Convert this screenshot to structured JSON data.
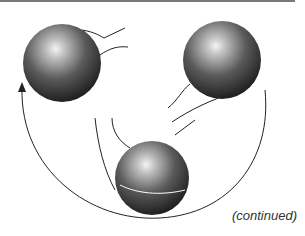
{
  "figure": {
    "caption": "(continued)",
    "balls": [
      {
        "name": "ball-left",
        "cx": 62,
        "cy": 63,
        "r": 39
      },
      {
        "name": "ball-right",
        "cx": 222,
        "cy": 60,
        "r": 39
      },
      {
        "name": "ball-bottom",
        "cx": 152,
        "cy": 178,
        "r": 37
      }
    ],
    "colors": {
      "ball_dark": "#2a2a2a",
      "ball_highlight": "#f2f2f2",
      "line": "#222222"
    }
  }
}
